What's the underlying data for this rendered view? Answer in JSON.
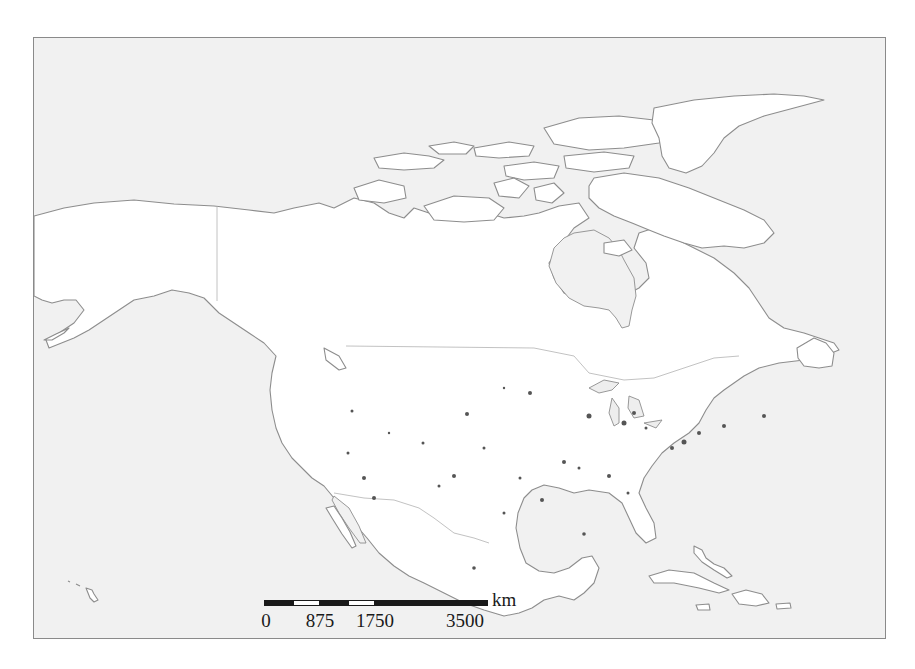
{
  "map": {
    "region": "North America",
    "projection_note": "Lambert-style conic view of North America with Greenland partially shown",
    "colors": {
      "ocean": "#f1f1f1",
      "land": "#ffffff",
      "coastline": "#8d8d8d",
      "border": "#b3b3b3",
      "cities": "#555555",
      "frame": "#8a8a8a"
    },
    "features": [
      "Alaska",
      "Canada",
      "Canadian Arctic Archipelago",
      "Greenland",
      "Hudson Bay",
      "United States",
      "Great Lakes",
      "Mexico",
      "Baja California",
      "Gulf of Mexico",
      "Florida",
      "Cuba",
      "Hispaniola",
      "Jamaica",
      "Puerto Rico",
      "Bahamas",
      "Hawaii",
      "Newfoundland",
      "Central America"
    ],
    "city_markers_count": 30
  },
  "scale_bar": {
    "unit": "km",
    "ticks": [
      {
        "label": "0",
        "x": 264
      },
      {
        "label": "875",
        "x": 320
      },
      {
        "label": "1750",
        "x": 375
      },
      {
        "label": "3500",
        "x": 488
      }
    ],
    "segments": [
      "black",
      "white",
      "black",
      "white",
      "black"
    ]
  }
}
